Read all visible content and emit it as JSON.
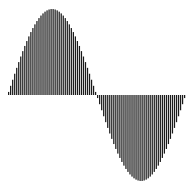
{
  "chart_data": {
    "type": "bar",
    "title": "",
    "xlabel": "",
    "ylabel": "",
    "function": "sin(x)",
    "x_range": [
      0,
      6.2832
    ],
    "ylim": [
      -1,
      1
    ],
    "grid": false,
    "legend": null,
    "bar_count": 88,
    "bar_color": "#1a1a1a",
    "gap_color": "#ffffff",
    "x": [
      0.0,
      0.0714,
      0.1428,
      0.2142,
      0.2856,
      0.357,
      0.4284,
      0.4998,
      0.5712,
      0.6426,
      0.714,
      0.7854,
      0.8568,
      0.9282,
      0.9996,
      1.071,
      1.1424,
      1.2138,
      1.2852,
      1.3566,
      1.428,
      1.4994,
      1.5708,
      1.6422,
      1.7136,
      1.785,
      1.8564,
      1.9278,
      1.9992,
      2.0706,
      2.142,
      2.2134,
      2.2848,
      2.3562,
      2.4276,
      2.499,
      2.5704,
      2.6418,
      2.7132,
      2.7846,
      2.856,
      2.9274,
      2.9988,
      3.0702,
      3.1416,
      3.213,
      3.2844,
      3.3558,
      3.4272,
      3.4986,
      3.57,
      3.6414,
      3.7128,
      3.7842,
      3.8556,
      3.927,
      3.9984,
      4.0698,
      4.1412,
      4.2126,
      4.284,
      4.3554,
      4.4268,
      4.4982,
      4.5696,
      4.641,
      4.7124,
      4.7838,
      4.8552,
      4.9266,
      4.998,
      5.0694,
      5.1408,
      5.2122,
      5.2836,
      5.355,
      5.4264,
      5.4978,
      5.5692,
      5.6406,
      5.712,
      5.7834,
      5.8548,
      5.9262,
      5.9976,
      6.069,
      6.1404,
      6.2118
    ]
  }
}
